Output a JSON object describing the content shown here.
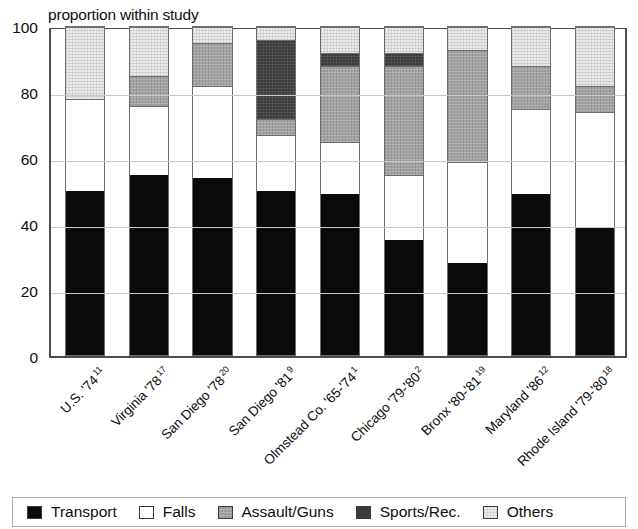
{
  "chart_data": {
    "type": "bar",
    "subtype": "stacked-bar-100",
    "title": "proportion within study",
    "xlabel": "",
    "ylabel": "",
    "ylim": [
      0,
      100
    ],
    "yticks": [
      0,
      20,
      40,
      60,
      80,
      100
    ],
    "ytick_labels": [
      "0",
      "20",
      "40",
      "60",
      "80",
      "100"
    ],
    "grid": true,
    "legend_position": "bottom",
    "categories": [
      "U.S. '74",
      "Virginia '78",
      "San Diego '78",
      "San Diego '81",
      "Olmstead Co. '65-'74",
      "Chicago '79-'80",
      "Bronx '80-'81",
      "Maryland '86",
      "Rhode Island '79-'80"
    ],
    "category_refs": [
      "11",
      "17",
      "20",
      "9",
      "1",
      "2",
      "19",
      "12",
      "18"
    ],
    "series": [
      {
        "name": "Transport",
        "color": "#0b0b0b",
        "values": [
          50,
          55,
          54,
          50,
          49,
          35,
          28,
          49,
          39
        ]
      },
      {
        "name": "Falls",
        "color": "#ffffff",
        "values": [
          28,
          21,
          28,
          17,
          16,
          20,
          31,
          26,
          35
        ]
      },
      {
        "name": "Assault/Guns",
        "color": "#a3a3a3",
        "values": [
          0,
          9,
          13,
          5,
          23,
          33,
          34,
          13,
          8
        ]
      },
      {
        "name": "Sports/Rec.",
        "color": "#3b3b3b",
        "values": [
          0,
          0,
          0,
          24,
          4,
          4,
          0,
          0,
          0
        ]
      },
      {
        "name": "Others",
        "color": "#ebebeb",
        "values": [
          22,
          15,
          5,
          4,
          8,
          8,
          7,
          12,
          18
        ]
      }
    ]
  },
  "legend": {
    "items": [
      {
        "label": "Transport",
        "swatch": "transport"
      },
      {
        "label": "Falls",
        "swatch": "falls"
      },
      {
        "label": "Assault/Guns",
        "swatch": "assault"
      },
      {
        "label": "Sports/Rec.",
        "swatch": "sports"
      },
      {
        "label": "Others",
        "swatch": "others"
      }
    ]
  }
}
